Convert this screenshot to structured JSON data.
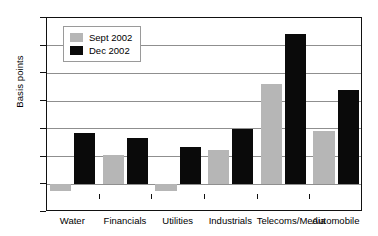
{
  "chart_data": {
    "type": "bar",
    "title": "",
    "xlabel": "",
    "ylabel": "Basis points",
    "ylim": [
      -50,
      300
    ],
    "ytick_step": 50,
    "yticks": [
      300,
      250,
      200,
      150,
      100,
      50,
      0,
      -50
    ],
    "ytick_labels": [
      "300",
      "250",
      "200",
      "150",
      "100",
      "50",
      "0",
      "−50"
    ],
    "grid": true,
    "legend_position": "upper left inside plot",
    "categories": [
      "Water",
      "Financials",
      "Utilities",
      "Industrials",
      "Telecoms/Media",
      "Automobile"
    ],
    "series": [
      {
        "name": "Sept 2002",
        "color": "#b6b6b6",
        "values": [
          -12,
          53,
          -12,
          62,
          181,
          97
        ]
      },
      {
        "name": "Dec 2002",
        "color": "#0a0a0a",
        "values": [
          92,
          84,
          67,
          100,
          271,
          171
        ]
      }
    ]
  },
  "legend": {
    "entries": [
      {
        "label": "Sept 2002",
        "swatch": "sept"
      },
      {
        "label": "Dec 2002",
        "swatch": "dec"
      }
    ]
  }
}
